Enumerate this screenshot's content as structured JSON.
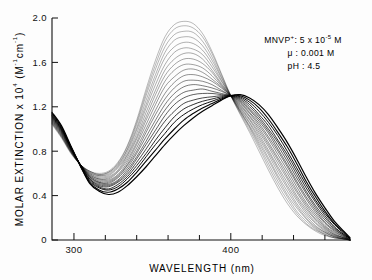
{
  "figure": {
    "background": "#fdfdfd",
    "ink_color": "#111111"
  },
  "annotation": {
    "line1_label": "MNVP",
    "line1_charge": "+",
    "line1_sep": ": 5 x 10",
    "line1_exp": "-5",
    "line1_unit": " M",
    "line2": "μ : 0.001 M",
    "line3": "pH : 4.5"
  },
  "chart_data": {
    "type": "line",
    "title": "",
    "xlabel": "WAVELENGTH  (nm)",
    "ylabel_main": "MOLAR EXTINCTION x 10",
    "ylabel_exp": "4",
    "ylabel_units_open": " (M",
    "ylabel_units_exp1": "-1",
    "ylabel_units_cm": "cm",
    "ylabel_units_exp2": "-1",
    "ylabel_units_close": ")",
    "xlim": [
      286,
      476
    ],
    "ylim": [
      0,
      2.0
    ],
    "xticks_major": [
      300,
      400
    ],
    "xtick_labels": [
      "300",
      "400"
    ],
    "xticks_minor": [
      310,
      320,
      330,
      340,
      350,
      360,
      370,
      380,
      390,
      410,
      420,
      430,
      440,
      450,
      460,
      470
    ],
    "yticks": [
      0,
      0.4,
      0.8,
      1.2,
      1.6,
      2.0
    ],
    "ytick_labels": [
      "0",
      "0.4",
      "0.8",
      "1.2",
      "1.6",
      "2.0"
    ],
    "grid": false,
    "legend": null,
    "isosbestic_point": {
      "x": 400,
      "y": 1.3
    },
    "series_count": 20,
    "x": [
      286,
      292,
      298,
      304,
      310,
      316,
      322,
      328,
      334,
      340,
      346,
      352,
      358,
      364,
      370,
      376,
      382,
      388,
      394,
      400,
      406,
      412,
      418,
      424,
      430,
      436,
      442,
      448,
      454,
      460,
      466,
      472,
      476
    ],
    "series": [
      {
        "name": "spectrum-01",
        "shade": 0.3,
        "values": [
          1.04,
          0.92,
          0.78,
          0.68,
          0.62,
          0.6,
          0.62,
          0.7,
          0.85,
          1.08,
          1.36,
          1.62,
          1.83,
          1.94,
          1.97,
          1.95,
          1.86,
          1.7,
          1.5,
          1.3,
          1.13,
          0.97,
          0.8,
          0.63,
          0.47,
          0.33,
          0.22,
          0.14,
          0.08,
          0.04,
          0.02,
          0.01,
          0.0
        ]
      },
      {
        "name": "spectrum-02",
        "shade": 0.32,
        "values": [
          1.05,
          0.93,
          0.79,
          0.68,
          0.62,
          0.59,
          0.61,
          0.69,
          0.84,
          1.06,
          1.33,
          1.58,
          1.79,
          1.9,
          1.93,
          1.91,
          1.83,
          1.68,
          1.49,
          1.3,
          1.14,
          0.99,
          0.83,
          0.66,
          0.5,
          0.36,
          0.24,
          0.15,
          0.09,
          0.05,
          0.02,
          0.01,
          0.0
        ]
      },
      {
        "name": "spectrum-03",
        "shade": 0.34,
        "values": [
          1.05,
          0.93,
          0.79,
          0.68,
          0.62,
          0.59,
          0.61,
          0.68,
          0.82,
          1.04,
          1.3,
          1.54,
          1.74,
          1.85,
          1.88,
          1.87,
          1.79,
          1.65,
          1.47,
          1.3,
          1.15,
          1.01,
          0.85,
          0.69,
          0.53,
          0.39,
          0.26,
          0.17,
          0.1,
          0.05,
          0.02,
          0.01,
          0.0
        ]
      },
      {
        "name": "spectrum-04",
        "shade": 0.36,
        "values": [
          1.06,
          0.94,
          0.79,
          0.68,
          0.61,
          0.58,
          0.6,
          0.67,
          0.81,
          1.01,
          1.26,
          1.49,
          1.69,
          1.8,
          1.83,
          1.82,
          1.75,
          1.62,
          1.46,
          1.3,
          1.16,
          1.02,
          0.87,
          0.72,
          0.56,
          0.41,
          0.29,
          0.19,
          0.11,
          0.06,
          0.03,
          0.01,
          0.0
        ]
      },
      {
        "name": "spectrum-05",
        "shade": 0.38,
        "values": [
          1.06,
          0.94,
          0.8,
          0.68,
          0.61,
          0.58,
          0.59,
          0.66,
          0.79,
          0.99,
          1.22,
          1.45,
          1.64,
          1.74,
          1.78,
          1.77,
          1.71,
          1.59,
          1.44,
          1.3,
          1.16,
          1.03,
          0.89,
          0.74,
          0.58,
          0.44,
          0.31,
          0.2,
          0.12,
          0.07,
          0.03,
          0.01,
          0.0
        ]
      },
      {
        "name": "spectrum-06",
        "shade": 0.4,
        "values": [
          1.07,
          0.95,
          0.8,
          0.68,
          0.6,
          0.57,
          0.58,
          0.65,
          0.77,
          0.96,
          1.19,
          1.4,
          1.58,
          1.69,
          1.73,
          1.72,
          1.67,
          1.56,
          1.43,
          1.3,
          1.17,
          1.05,
          0.91,
          0.77,
          0.61,
          0.47,
          0.33,
          0.22,
          0.13,
          0.07,
          0.03,
          0.01,
          0.0
        ]
      },
      {
        "name": "spectrum-07",
        "shade": 0.43,
        "values": [
          1.07,
          0.95,
          0.8,
          0.68,
          0.6,
          0.56,
          0.57,
          0.63,
          0.76,
          0.93,
          1.15,
          1.35,
          1.53,
          1.63,
          1.68,
          1.68,
          1.63,
          1.53,
          1.41,
          1.3,
          1.18,
          1.06,
          0.93,
          0.79,
          0.64,
          0.49,
          0.36,
          0.24,
          0.15,
          0.08,
          0.04,
          0.01,
          0.0
        ]
      },
      {
        "name": "spectrum-08",
        "shade": 0.46,
        "values": [
          1.08,
          0.96,
          0.81,
          0.68,
          0.59,
          0.55,
          0.56,
          0.62,
          0.74,
          0.91,
          1.11,
          1.31,
          1.48,
          1.58,
          1.63,
          1.63,
          1.59,
          1.51,
          1.4,
          1.3,
          1.19,
          1.08,
          0.95,
          0.81,
          0.66,
          0.52,
          0.38,
          0.26,
          0.16,
          0.09,
          0.04,
          0.02,
          0.0
        ]
      },
      {
        "name": "spectrum-09",
        "shade": 0.49,
        "values": [
          1.08,
          0.96,
          0.81,
          0.68,
          0.59,
          0.55,
          0.55,
          0.61,
          0.72,
          0.88,
          1.08,
          1.26,
          1.43,
          1.53,
          1.58,
          1.58,
          1.55,
          1.48,
          1.39,
          1.3,
          1.2,
          1.09,
          0.97,
          0.84,
          0.69,
          0.55,
          0.4,
          0.28,
          0.18,
          0.1,
          0.05,
          0.02,
          0.0
        ]
      },
      {
        "name": "spectrum-10",
        "shade": 0.52,
        "values": [
          1.09,
          0.97,
          0.81,
          0.68,
          0.58,
          0.54,
          0.54,
          0.59,
          0.7,
          0.86,
          1.04,
          1.22,
          1.38,
          1.47,
          1.53,
          1.54,
          1.51,
          1.45,
          1.38,
          1.3,
          1.21,
          1.11,
          0.99,
          0.86,
          0.72,
          0.57,
          0.43,
          0.3,
          0.19,
          0.11,
          0.05,
          0.02,
          0.0
        ]
      },
      {
        "name": "spectrum-11",
        "shade": 0.56,
        "values": [
          1.09,
          0.97,
          0.82,
          0.68,
          0.58,
          0.53,
          0.53,
          0.58,
          0.68,
          0.83,
          1.0,
          1.17,
          1.32,
          1.42,
          1.48,
          1.49,
          1.47,
          1.43,
          1.37,
          1.3,
          1.22,
          1.12,
          1.01,
          0.88,
          0.74,
          0.6,
          0.45,
          0.32,
          0.21,
          0.12,
          0.06,
          0.02,
          0.0
        ]
      },
      {
        "name": "spectrum-12",
        "shade": 0.6,
        "values": [
          1.1,
          0.98,
          0.82,
          0.68,
          0.57,
          0.52,
          0.52,
          0.57,
          0.67,
          0.8,
          0.97,
          1.13,
          1.27,
          1.37,
          1.43,
          1.44,
          1.43,
          1.4,
          1.35,
          1.3,
          1.23,
          1.14,
          1.03,
          0.91,
          0.77,
          0.63,
          0.48,
          0.34,
          0.23,
          0.13,
          0.07,
          0.03,
          0.0
        ]
      },
      {
        "name": "spectrum-13",
        "shade": 0.64,
        "values": [
          1.1,
          0.98,
          0.82,
          0.68,
          0.57,
          0.52,
          0.51,
          0.56,
          0.65,
          0.78,
          0.93,
          1.08,
          1.22,
          1.32,
          1.38,
          1.4,
          1.39,
          1.37,
          1.34,
          1.3,
          1.24,
          1.15,
          1.05,
          0.93,
          0.8,
          0.66,
          0.51,
          0.37,
          0.25,
          0.15,
          0.08,
          0.03,
          0.0
        ]
      },
      {
        "name": "spectrum-14",
        "shade": 0.69,
        "values": [
          1.11,
          0.99,
          0.83,
          0.68,
          0.56,
          0.51,
          0.5,
          0.54,
          0.63,
          0.75,
          0.89,
          1.04,
          1.17,
          1.27,
          1.33,
          1.35,
          1.36,
          1.34,
          1.32,
          1.3,
          1.25,
          1.17,
          1.07,
          0.96,
          0.82,
          0.68,
          0.53,
          0.39,
          0.27,
          0.16,
          0.09,
          0.04,
          0.0
        ]
      },
      {
        "name": "spectrum-15",
        "shade": 0.74,
        "values": [
          1.11,
          0.99,
          0.83,
          0.68,
          0.55,
          0.5,
          0.49,
          0.53,
          0.61,
          0.73,
          0.86,
          0.99,
          1.12,
          1.22,
          1.28,
          1.31,
          1.32,
          1.32,
          1.31,
          1.3,
          1.26,
          1.18,
          1.09,
          0.98,
          0.85,
          0.71,
          0.56,
          0.42,
          0.29,
          0.18,
          0.1,
          0.04,
          0.0
        ]
      },
      {
        "name": "spectrum-16",
        "shade": 0.79,
        "values": [
          1.12,
          1.0,
          0.83,
          0.68,
          0.55,
          0.49,
          0.48,
          0.52,
          0.59,
          0.7,
          0.82,
          0.95,
          1.07,
          1.16,
          1.23,
          1.26,
          1.28,
          1.29,
          1.3,
          1.3,
          1.27,
          1.2,
          1.11,
          1.0,
          0.88,
          0.74,
          0.59,
          0.44,
          0.31,
          0.2,
          0.11,
          0.05,
          0.01
        ]
      },
      {
        "name": "spectrum-17",
        "shade": 0.85,
        "values": [
          1.12,
          1.0,
          0.84,
          0.68,
          0.54,
          0.48,
          0.46,
          0.5,
          0.57,
          0.67,
          0.78,
          0.9,
          1.01,
          1.11,
          1.18,
          1.22,
          1.25,
          1.27,
          1.29,
          1.3,
          1.28,
          1.22,
          1.13,
          1.03,
          0.9,
          0.77,
          0.62,
          0.47,
          0.34,
          0.22,
          0.12,
          0.05,
          0.01
        ]
      },
      {
        "name": "spectrum-18",
        "shade": 0.9,
        "values": [
          1.13,
          1.01,
          0.84,
          0.67,
          0.53,
          0.47,
          0.45,
          0.48,
          0.55,
          0.64,
          0.75,
          0.86,
          0.96,
          1.06,
          1.13,
          1.18,
          1.22,
          1.25,
          1.28,
          1.3,
          1.29,
          1.24,
          1.16,
          1.06,
          0.94,
          0.8,
          0.65,
          0.5,
          0.36,
          0.24,
          0.14,
          0.06,
          0.01
        ]
      },
      {
        "name": "spectrum-19",
        "shade": 0.96,
        "values": [
          1.14,
          1.02,
          0.84,
          0.67,
          0.52,
          0.45,
          0.43,
          0.46,
          0.52,
          0.61,
          0.71,
          0.81,
          0.91,
          1.0,
          1.08,
          1.14,
          1.19,
          1.23,
          1.27,
          1.3,
          1.3,
          1.26,
          1.19,
          1.09,
          0.97,
          0.84,
          0.69,
          0.53,
          0.39,
          0.26,
          0.15,
          0.07,
          0.01
        ]
      },
      {
        "name": "spectrum-20",
        "shade": 1.0,
        "values": [
          1.15,
          1.03,
          0.85,
          0.67,
          0.51,
          0.44,
          0.41,
          0.43,
          0.49,
          0.57,
          0.66,
          0.76,
          0.86,
          0.95,
          1.03,
          1.1,
          1.16,
          1.21,
          1.26,
          1.3,
          1.31,
          1.28,
          1.22,
          1.13,
          1.01,
          0.88,
          0.73,
          0.57,
          0.42,
          0.29,
          0.17,
          0.08,
          0.02
        ]
      }
    ]
  }
}
